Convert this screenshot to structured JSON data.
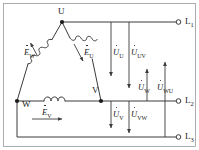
{
  "diagram": {
    "stroke_color": "#3a3a3a",
    "text_color": "#1a1a1a",
    "background": "#ffffff",
    "border_color": "#9a9a9a"
  },
  "nodes": [
    {
      "id": "U",
      "label": "U"
    },
    {
      "id": "V",
      "label": "V"
    },
    {
      "id": "W",
      "label": "W"
    }
  ],
  "terminals": [
    {
      "id": "L1",
      "label": "L",
      "sub": "1"
    },
    {
      "id": "L2",
      "label": "L",
      "sub": "2"
    },
    {
      "id": "L3",
      "label": "L",
      "sub": "3"
    }
  ],
  "emf_labels": [
    {
      "id": "EW",
      "symbol": "E",
      "sub": "W"
    },
    {
      "id": "EU",
      "symbol": "E",
      "sub": "U"
    },
    {
      "id": "EV",
      "symbol": "E",
      "sub": "V"
    }
  ],
  "voltage_labels": [
    {
      "id": "UU",
      "symbol": "U",
      "sub": "U",
      "direction": "down"
    },
    {
      "id": "UUV",
      "symbol": "U",
      "sub": "UV",
      "direction": "down"
    },
    {
      "id": "UV",
      "symbol": "U",
      "sub": "V",
      "direction": "down"
    },
    {
      "id": "UVW",
      "symbol": "U",
      "sub": "VW",
      "direction": "down"
    },
    {
      "id": "UW",
      "symbol": "U",
      "sub": "W",
      "direction": "up"
    },
    {
      "id": "UWU",
      "symbol": "U",
      "sub": "WU",
      "direction": "up"
    }
  ]
}
